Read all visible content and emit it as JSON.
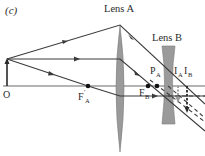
{
  "figure": {
    "panel_label": "(c)",
    "lens_a_label": "Lens A",
    "lens_b_label": "Lens B",
    "object_label": "O",
    "focal_a_prime_label": "F",
    "focal_a_prime_sub": "A",
    "focal_a_prime_mark": "′",
    "point_pa_label": "P",
    "point_pa_sub": "A",
    "focal_b_label": "F",
    "focal_b_sub": "B",
    "image_a_label": "I",
    "image_a_sub": "A",
    "image_b_label": "I",
    "image_b_sub": "B"
  },
  "colors": {
    "ray": "#3a3a3a",
    "lens_fill": "#9a9a9a",
    "axis": "#555555",
    "image_a_arrow": "#9a9a9a",
    "image_b_arrow": "#2a2a2a"
  }
}
